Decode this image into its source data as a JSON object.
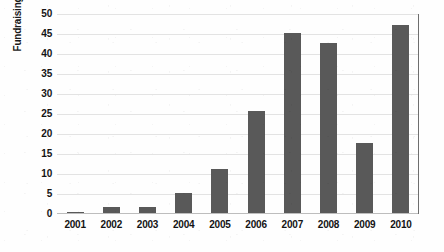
{
  "chart_data": {
    "type": "bar",
    "title": "",
    "xlabel": "",
    "ylabel": "Fundraising in $B",
    "categories": [
      "2001",
      "2002",
      "2003",
      "2004",
      "2005",
      "2006",
      "2007",
      "2008",
      "2009",
      "2010"
    ],
    "values": [
      0.3,
      1.5,
      1.5,
      5,
      11,
      25.5,
      45,
      42.5,
      17.5,
      47
    ],
    "ylim": [
      0,
      50
    ],
    "ytick_values": [
      0,
      5,
      10,
      15,
      20,
      25,
      30,
      35,
      40,
      45,
      50
    ],
    "ytick_labels": [
      "0",
      "5",
      "10",
      "15",
      "20",
      "25",
      "30",
      "35",
      "40",
      "45",
      "50"
    ],
    "grid": true,
    "grid_axis": "y",
    "legend": false,
    "legend_position": "none",
    "bar_color": "#595959",
    "gridline_color": "#e3e3e3",
    "axis_color": "#6e6e6e",
    "background_color": "#ffffff",
    "text_color": "#141414"
  }
}
